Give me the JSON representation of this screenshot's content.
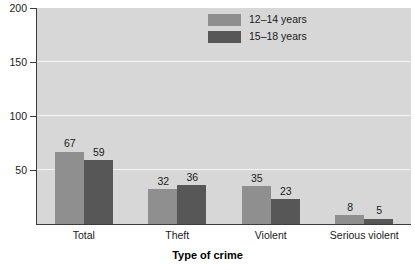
{
  "chart_data": {
    "type": "bar",
    "title": "",
    "subtitle": "",
    "xlabel": "Type of crime",
    "ylabel": "",
    "categories": [
      "Total",
      "Theft",
      "Violent",
      "Serious violent"
    ],
    "series": [
      {
        "name": "12–14 years",
        "color": "#8f8f8f",
        "values": [
          67,
          32,
          35,
          8
        ]
      },
      {
        "name": "15–18 years",
        "color": "#575757",
        "values": [
          59,
          36,
          23,
          5
        ]
      }
    ],
    "ylim": [
      0,
      200
    ],
    "yticks": [
      50,
      100,
      150,
      200
    ],
    "ytick_labels": [
      "50",
      "100",
      "150",
      "200"
    ],
    "grid": true,
    "grid_color": "#f4f4f4",
    "legend_position": "top-right",
    "plot_background": "#d7d7d7",
    "figure_background": "#ffffff",
    "axis_color": "#3c3c3c",
    "data_labels": true
  }
}
